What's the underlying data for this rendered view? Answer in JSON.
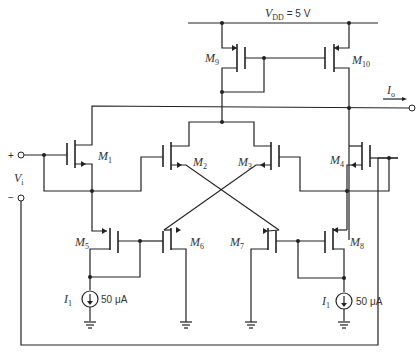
{
  "diagram": {
    "type": "circuit-schematic",
    "supply": {
      "label": "V",
      "sub": "DD",
      "value": " = 5 V"
    },
    "output": {
      "label": "I",
      "sub": "o"
    },
    "input": {
      "label": "V",
      "sub": "i",
      "plus": "+",
      "minus": "−"
    },
    "transistors": [
      {
        "name": "M",
        "sub": "1"
      },
      {
        "name": "M",
        "sub": "2"
      },
      {
        "name": "M",
        "sub": "3"
      },
      {
        "name": "M",
        "sub": "4"
      },
      {
        "name": "M",
        "sub": "5"
      },
      {
        "name": "M",
        "sub": "6"
      },
      {
        "name": "M",
        "sub": "7"
      },
      {
        "name": "M",
        "sub": "8"
      },
      {
        "name": "M",
        "sub": "9"
      },
      {
        "name": "M",
        "sub": "10"
      }
    ],
    "sources": [
      {
        "name": "I",
        "sub": "1",
        "value": "50 μA"
      },
      {
        "name": "I",
        "sub": "1",
        "value": "50 μA"
      }
    ]
  }
}
